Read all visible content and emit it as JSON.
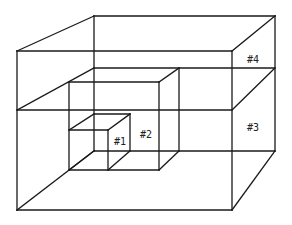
{
  "diagram": {
    "title": "",
    "stroke_color": "#1a1a1a",
    "background_color": "#ffffff",
    "labels": {
      "box1": "#1",
      "box2": "#2",
      "box3": "#3",
      "box4": "#4"
    }
  }
}
